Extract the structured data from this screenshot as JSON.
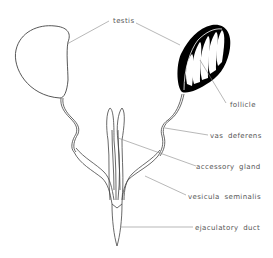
{
  "diagram": {
    "labels": {
      "testis": "testis",
      "follicle": "follicle",
      "vas_deferens": "vas deferens",
      "accessory_gland": "accessory gland",
      "vesicula_seminalis": "vesicula seminalis",
      "ejaculatory_duct": "ejaculatory duct"
    },
    "colors": {
      "outline": "#444444",
      "leader": "#888888",
      "fill_dark": "#000000",
      "background": "#ffffff"
    }
  }
}
